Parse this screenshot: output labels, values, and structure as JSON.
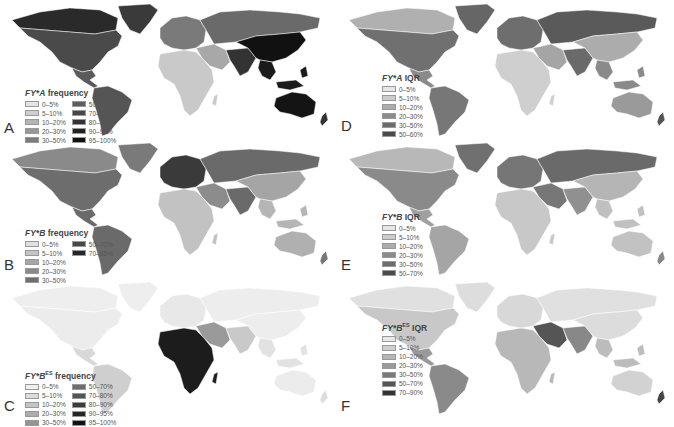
{
  "figure": {
    "panels": [
      {
        "letter": "A",
        "title_gene": "FY*A",
        "title_sup": "",
        "title_suffix": " frequency",
        "legend_columns": [
          [
            {
              "label": "0–5%",
              "color": "#e4e4e4"
            },
            {
              "label": "5–10%",
              "color": "#cfcfcf"
            },
            {
              "label": "10–20%",
              "color": "#b4b4b4"
            },
            {
              "label": "20–30%",
              "color": "#979797"
            },
            {
              "label": "30–50%",
              "color": "#7b7b7b"
            }
          ],
          [
            {
              "label": "50–70%",
              "color": "#5e5e5e"
            },
            {
              "label": "70–80%",
              "color": "#474747"
            },
            {
              "label": "80–90%",
              "color": "#333333"
            },
            {
              "label": "90–95%",
              "color": "#222222"
            },
            {
              "label": "95–100%",
              "color": "#111111"
            }
          ]
        ],
        "regions": {
          "north_america": "#4a4a4a",
          "arctic_canada": "#2a2a2a",
          "greenland": "#3a3a3a",
          "central_america": "#5a5a5a",
          "south_america": "#555555",
          "europe": "#7a7a7a",
          "africa": "#c9c9c9",
          "middle_east": "#a8a8a8",
          "russia": "#6a6a6a",
          "east_asia": "#111111",
          "south_asia": "#333333",
          "southeast_asia": "#1a1a1a",
          "australia": "#141414",
          "new_zealand": "#333333"
        }
      },
      {
        "letter": "B",
        "title_gene": "FY*B",
        "title_sup": "",
        "title_suffix": " frequency",
        "legend_columns": [
          [
            {
              "label": "0–5%",
              "color": "#e0e0e0"
            },
            {
              "label": "5–10%",
              "color": "#c4c4c4"
            },
            {
              "label": "10–20%",
              "color": "#a6a6a6"
            },
            {
              "label": "20–30%",
              "color": "#8a8a8a"
            },
            {
              "label": "30–50%",
              "color": "#6e6e6e"
            }
          ],
          [
            {
              "label": "50–70%",
              "color": "#484848"
            },
            {
              "label": "70–85%",
              "color": "#262626"
            }
          ]
        ],
        "regions": {
          "north_america": "#6d6d6d",
          "arctic_canada": "#8a8a8a",
          "greenland": "#7a7a7a",
          "central_america": "#6a6a6a",
          "south_america": "#6a6a6a",
          "europe": "#3a3a3a",
          "africa": "#c2c2c2",
          "middle_east": "#8c8c8c",
          "russia": "#6a6a6a",
          "east_asia": "#a5a5a5",
          "south_asia": "#6a6a6a",
          "southeast_asia": "#b5b5b5",
          "australia": "#b0b0b0",
          "new_zealand": "#777777"
        }
      },
      {
        "letter": "C",
        "title_gene": "FY*B",
        "title_sup": "ES",
        "title_suffix": " frequency",
        "legend_columns": [
          [
            {
              "label": "0–5%",
              "color": "#f0f0f0"
            },
            {
              "label": "5–10%",
              "color": "#dcdcdc"
            },
            {
              "label": "10–20%",
              "color": "#c4c4c4"
            },
            {
              "label": "20–30%",
              "color": "#acacac"
            },
            {
              "label": "30–50%",
              "color": "#949494"
            }
          ],
          [
            {
              "label": "50–70%",
              "color": "#6e6e6e"
            },
            {
              "label": "70–80%",
              "color": "#555555"
            },
            {
              "label": "80–90%",
              "color": "#3c3c3c"
            },
            {
              "label": "90–95%",
              "color": "#262626"
            },
            {
              "label": "95–100%",
              "color": "#121212"
            }
          ]
        ],
        "regions": {
          "north_america": "#ececec",
          "arctic_canada": "#eeeeee",
          "greenland": "#eeeeee",
          "central_america": "#d8d8d8",
          "south_america": "#cfcfcf",
          "europe": "#e8e8e8",
          "africa": "#1c1c1c",
          "middle_east": "#9a9a9a",
          "russia": "#ededed",
          "east_asia": "#ededed",
          "south_asia": "#c9c9c9",
          "southeast_asia": "#e2e2e2",
          "australia": "#ececec",
          "new_zealand": "#dddddd"
        }
      },
      {
        "letter": "D",
        "title_gene": "FY*A",
        "title_sup": "",
        "title_suffix": " IQR",
        "legend_columns": [
          [
            {
              "label": "0–5%",
              "color": "#e6e6e6"
            },
            {
              "label": "5–10%",
              "color": "#cccccc"
            },
            {
              "label": "10–20%",
              "color": "#acacac"
            },
            {
              "label": "20–30%",
              "color": "#8c8c8c"
            },
            {
              "label": "30–50%",
              "color": "#6c6c6c"
            },
            {
              "label": "50–60%",
              "color": "#4a4a4a"
            }
          ]
        ],
        "regions": {
          "north_america": "#707070",
          "arctic_canada": "#b0b0b0",
          "greenland": "#666666",
          "central_america": "#8a8a8a",
          "south_america": "#777777",
          "europe": "#6e6e6e",
          "africa": "#cfcfcf",
          "middle_east": "#a5a5a5",
          "russia": "#5a5a5a",
          "east_asia": "#acacac",
          "south_asia": "#6a6a6a",
          "southeast_asia": "#8a8a8a",
          "australia": "#9a9a9a",
          "new_zealand": "#555555"
        }
      },
      {
        "letter": "E",
        "title_gene": "FY*B",
        "title_sup": "",
        "title_suffix": " IQR",
        "legend_columns": [
          [
            {
              "label": "0–5%",
              "color": "#e6e6e6"
            },
            {
              "label": "5–10%",
              "color": "#cccccc"
            },
            {
              "label": "10–20%",
              "color": "#acacac"
            },
            {
              "label": "20–30%",
              "color": "#8c8c8c"
            },
            {
              "label": "30–50%",
              "color": "#6c6c6c"
            },
            {
              "label": "50–70%",
              "color": "#4a4a4a"
            }
          ]
        ],
        "regions": {
          "north_america": "#8a8a8a",
          "arctic_canada": "#b8b8b8",
          "greenland": "#707070",
          "central_america": "#a0a0a0",
          "south_america": "#a5a5a5",
          "europe": "#767676",
          "africa": "#c8c8c8",
          "middle_east": "#777777",
          "russia": "#6a6a6a",
          "east_asia": "#b5b5b5",
          "south_asia": "#909090",
          "southeast_asia": "#c0c0c0",
          "australia": "#c2c2c2",
          "new_zealand": "#888888"
        }
      },
      {
        "letter": "F",
        "title_gene": "FY*B",
        "title_sup": "ES",
        "title_suffix": " IQR",
        "legend_columns": [
          [
            {
              "label": "0–5%",
              "color": "#e8e8e8"
            },
            {
              "label": "5–10%",
              "color": "#d0d0d0"
            },
            {
              "label": "10–20%",
              "color": "#b6b6b6"
            },
            {
              "label": "20–30%",
              "color": "#9a9a9a"
            },
            {
              "label": "30–50%",
              "color": "#7a7a7a"
            },
            {
              "label": "50–70%",
              "color": "#555555"
            },
            {
              "label": "70–90%",
              "color": "#333333"
            }
          ]
        ],
        "regions": {
          "north_america": "#c8c8c8",
          "arctic_canada": "#e0e0e0",
          "greenland": "#dddddd",
          "central_america": "#999999",
          "south_america": "#8a8a8a",
          "europe": "#d8d8d8",
          "africa": "#b8b8b8",
          "middle_east": "#555555",
          "russia": "#e0e0e0",
          "east_asia": "#dcdcdc",
          "south_asia": "#888888",
          "southeast_asia": "#bcbcbc",
          "australia": "#d2d2d2",
          "new_zealand": "#444444"
        }
      }
    ]
  }
}
